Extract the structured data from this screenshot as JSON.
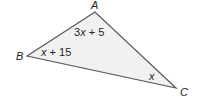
{
  "figure": {
    "type": "triangle",
    "vertices": [
      {
        "name": "A",
        "label": "A"
      },
      {
        "name": "B",
        "label": "B"
      },
      {
        "name": "C",
        "label": "C"
      }
    ],
    "angles": [
      {
        "vertex": "A",
        "expr_coef": "3",
        "expr_var": "x",
        "expr_rest": " + 5"
      },
      {
        "vertex": "B",
        "expr_coef": "",
        "expr_var": "x",
        "expr_rest": " + 15"
      },
      {
        "vertex": "C",
        "expr_coef": "",
        "expr_var": "x",
        "expr_rest": ""
      }
    ],
    "colors": {
      "fill": "#f1f1f2",
      "stroke": "#58595b",
      "text": "#231f20"
    }
  }
}
